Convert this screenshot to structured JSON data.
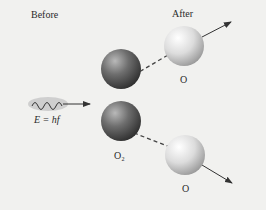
{
  "labels": {
    "before": "Before",
    "after": "After",
    "photon_energy": "E = hf",
    "molecule": "O₂",
    "atom_top": "O",
    "atom_bottom": "O"
  },
  "colors": {
    "background": "#f1f1ef",
    "molecule_dark": "#555555",
    "atom_light": "#d9d9d9",
    "photon_cloud": "#c8c8c8",
    "arrow": "#333333"
  }
}
